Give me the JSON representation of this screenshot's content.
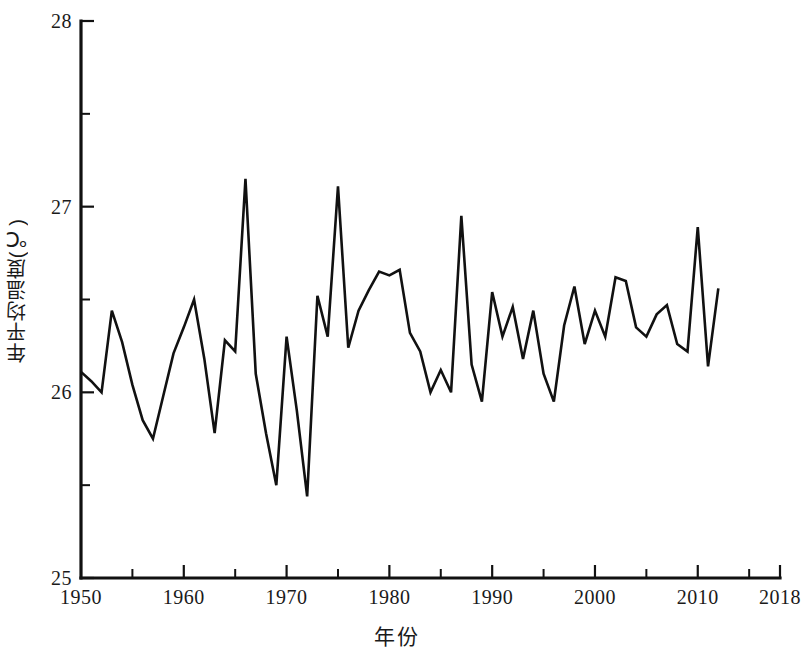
{
  "chart_data": {
    "type": "line",
    "title": "",
    "xlabel": "年份",
    "ylabel": "年平均温度(℃)",
    "xlim": [
      1950,
      2018
    ],
    "ylim": [
      25,
      28
    ],
    "grid": false,
    "legend": null,
    "line_color": "#111111",
    "x_major_ticks": [
      1950,
      1960,
      1970,
      1980,
      1990,
      2000,
      2010,
      2018
    ],
    "x_major_tick_labels": [
      "1950",
      "1960",
      "1970",
      "1980",
      "1990",
      "2000",
      "2010",
      "2018"
    ],
    "x_minor_ticks": [
      1955,
      1965,
      1975,
      1985,
      1995,
      2005,
      2015
    ],
    "y_major_ticks": [
      25,
      26,
      27,
      28
    ],
    "y_major_tick_labels": [
      "25",
      "26",
      "27",
      "28"
    ],
    "y_minor_ticks": [
      25.5,
      26.5,
      27.5
    ],
    "series": [
      {
        "name": "年平均温度",
        "x": [
          1950,
          1951,
          1952,
          1953,
          1954,
          1955,
          1956,
          1957,
          1958,
          1959,
          1960,
          1961,
          1962,
          1963,
          1964,
          1965,
          1966,
          1967,
          1968,
          1969,
          1970,
          1971,
          1972,
          1973,
          1974,
          1975,
          1976,
          1977,
          1978,
          1979,
          1980,
          1981,
          1982,
          1983,
          1984,
          1985,
          1986,
          1987,
          1988,
          1989,
          1990,
          1991,
          1992,
          1993,
          1994,
          1995,
          1996,
          1997,
          1998,
          1999,
          2000,
          2001,
          2002,
          2003,
          2004,
          2005,
          2006,
          2007,
          2008,
          2009,
          2010,
          2011,
          2012
        ],
        "values": [
          26.11,
          26.06,
          26.0,
          26.44,
          26.27,
          26.04,
          25.85,
          25.75,
          25.98,
          26.21,
          26.35,
          26.5,
          26.18,
          25.78,
          26.28,
          26.22,
          27.15,
          26.1,
          25.78,
          25.5,
          26.3,
          25.9,
          25.44,
          26.52,
          26.3,
          27.11,
          26.24,
          26.44,
          26.55,
          26.65,
          26.63,
          26.66,
          26.32,
          26.22,
          26.0,
          26.12,
          26.0,
          26.95,
          26.15,
          25.95,
          26.54,
          26.3,
          26.46,
          26.18,
          26.44,
          26.1,
          25.95,
          26.36,
          26.57,
          26.26,
          26.44,
          26.3,
          26.62,
          26.6,
          26.35,
          26.3,
          26.42,
          26.47,
          26.26,
          26.22,
          26.89,
          26.14,
          26.56
        ]
      }
    ]
  },
  "axis": {
    "y_label": "年平均温度(℃)",
    "x_label": "年份"
  }
}
